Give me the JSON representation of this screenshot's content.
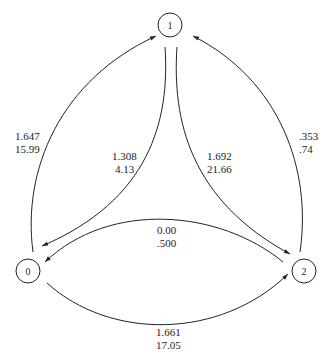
{
  "diagram": {
    "type": "state-transition-graph",
    "nodes": [
      {
        "id": "0",
        "label": "0"
      },
      {
        "id": "1",
        "label": "1"
      },
      {
        "id": "2",
        "label": "2"
      }
    ],
    "edges": [
      {
        "from": "0",
        "to": "1",
        "label_line1": "1.647",
        "label_line2": "15.99"
      },
      {
        "from": "1",
        "to": "0",
        "label_line1": "1.308",
        "label_line2": "4.13"
      },
      {
        "from": "1",
        "to": "2",
        "label_line1": "1.692",
        "label_line2": "21.66"
      },
      {
        "from": "2",
        "to": "1",
        "label_line1": ".353",
        "label_line2": ".74"
      },
      {
        "from": "2",
        "to": "0",
        "label_line1": "0.00",
        "label_line2": ".500"
      },
      {
        "from": "0",
        "to": "2",
        "label_line1": "1.661",
        "label_line2": "17.05"
      }
    ]
  }
}
